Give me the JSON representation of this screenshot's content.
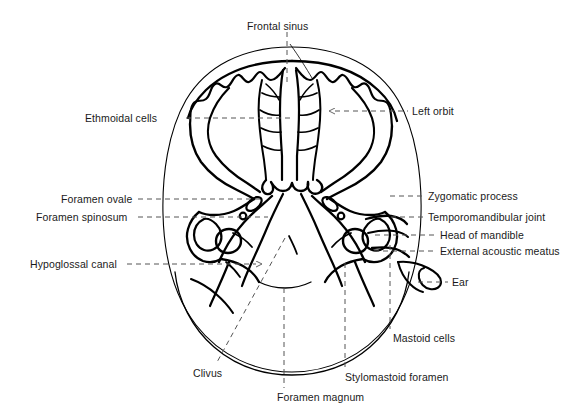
{
  "figure": {
    "type": "anatomical-line-diagram",
    "background_color": "#ffffff",
    "outline_color": "#000000",
    "leader_color": "#555555",
    "text_color": "#1a1a1a",
    "width": 588,
    "height": 419
  },
  "labels": [
    {
      "id": "frontal-sinus",
      "text": "Frontal sinus",
      "x": 247,
      "y": 20,
      "align": "left",
      "side": "top"
    },
    {
      "id": "ethmoidal-cells",
      "text": "Ethmoidal cells",
      "x": 85,
      "y": 112,
      "align": "left",
      "side": "left"
    },
    {
      "id": "left-orbit",
      "text": "Left orbit",
      "x": 412,
      "y": 106,
      "align": "left",
      "side": "right"
    },
    {
      "id": "foramen-ovale",
      "text": "Foramen ovale",
      "x": 61,
      "y": 194,
      "align": "left",
      "side": "left"
    },
    {
      "id": "foramen-spinosum",
      "text": "Foramen spinosum",
      "x": 36,
      "y": 212,
      "align": "left",
      "side": "left"
    },
    {
      "id": "zygomatic-process",
      "text": "Zygomatic process",
      "x": 428,
      "y": 191,
      "align": "left",
      "side": "right"
    },
    {
      "id": "temporomandibular-joint",
      "text": "Temporomandibular joint",
      "x": 428,
      "y": 212,
      "align": "left",
      "side": "right"
    },
    {
      "id": "head-of-mandible",
      "text": "Head of mandible",
      "x": 440,
      "y": 230,
      "align": "left",
      "side": "right"
    },
    {
      "id": "external-acoustic-meatus",
      "text": "External acoustic meatus",
      "x": 440,
      "y": 246,
      "align": "left",
      "side": "right"
    },
    {
      "id": "hypoglossal-canal",
      "text": "Hypoglossal canal",
      "x": 30,
      "y": 259,
      "align": "left",
      "side": "left"
    },
    {
      "id": "ear",
      "text": "Ear",
      "x": 452,
      "y": 277,
      "align": "left",
      "side": "right"
    },
    {
      "id": "mastoid-cells",
      "text": "Mastoid cells",
      "x": 393,
      "y": 333,
      "align": "left",
      "side": "bottom"
    },
    {
      "id": "clivus",
      "text": "Clivus",
      "x": 193,
      "y": 368,
      "align": "left",
      "side": "bottom"
    },
    {
      "id": "stylomastoid-foramen",
      "text": "Stylomastoid foramen",
      "x": 345,
      "y": 372,
      "align": "left",
      "side": "bottom"
    },
    {
      "id": "foramen-magnum",
      "text": "Foramen magnum",
      "x": 277,
      "y": 392,
      "align": "left",
      "side": "bottom"
    }
  ],
  "structures": [
    {
      "id": "scalp-outline",
      "name": "Outer scalp / soft-tissue outline"
    },
    {
      "id": "cranial-vault",
      "name": "Inner table of cranial vault"
    },
    {
      "id": "orbit-left",
      "name": "Left orbit"
    },
    {
      "id": "orbit-right",
      "name": "Right orbit"
    },
    {
      "id": "ethmoid-sinuses",
      "name": "Ethmoidal air cells / nasal septum"
    },
    {
      "id": "sphenoid",
      "name": "Sphenoid body and greater wings"
    },
    {
      "id": "petrous-temporal",
      "name": "Petrous temporal bones"
    },
    {
      "id": "mastoid",
      "name": "Mastoid air cells"
    },
    {
      "id": "mandible-condyle",
      "name": "Head of mandible"
    },
    {
      "id": "auricle",
      "name": "External ear (auricle)"
    },
    {
      "id": "occiput",
      "name": "Occipital bone / posterior fossa"
    }
  ]
}
